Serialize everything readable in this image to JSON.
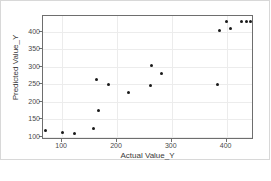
{
  "chart_data": {
    "type": "scatter",
    "title": "",
    "xlabel": "Actual Value_Y",
    "ylabel": "Predicted Value_Y",
    "xlim": [
      65,
      450
    ],
    "ylim": [
      90,
      445
    ],
    "xticks": [
      100,
      200,
      300,
      400
    ],
    "yticks": [
      100,
      150,
      200,
      250,
      300,
      350,
      400
    ],
    "grid": true,
    "legend": false,
    "marker": {
      "shape": "circle",
      "color": "#1a1a1a",
      "size": 3
    },
    "series": [
      {
        "name": "predictions",
        "points": [
          {
            "x": 70,
            "y": 118
          },
          {
            "x": 100,
            "y": 111
          },
          {
            "x": 123,
            "y": 110
          },
          {
            "x": 158,
            "y": 122
          },
          {
            "x": 163,
            "y": 264
          },
          {
            "x": 167,
            "y": 174
          },
          {
            "x": 184,
            "y": 249
          },
          {
            "x": 221,
            "y": 227
          },
          {
            "x": 261,
            "y": 246
          },
          {
            "x": 263,
            "y": 303
          },
          {
            "x": 281,
            "y": 281
          },
          {
            "x": 383,
            "y": 249
          },
          {
            "x": 387,
            "y": 404
          },
          {
            "x": 399,
            "y": 430
          },
          {
            "x": 408,
            "y": 410
          },
          {
            "x": 428,
            "y": 429
          },
          {
            "x": 437,
            "y": 429
          },
          {
            "x": 443,
            "y": 429
          }
        ]
      }
    ]
  },
  "axes": {
    "x_tick_labels": [
      "100",
      "200",
      "300",
      "400"
    ],
    "y_tick_labels": [
      "400",
      "350",
      "300",
      "250",
      "200",
      "150",
      "100"
    ]
  },
  "colors": {
    "marker": "#1a1a1a",
    "grid": "#ececec",
    "frame": "#6e6e6e",
    "card_border": "#d8d8d8",
    "background": "#ffffff",
    "tick_text": "#4a4a4a",
    "axis_label_text": "#3a3a3a"
  }
}
